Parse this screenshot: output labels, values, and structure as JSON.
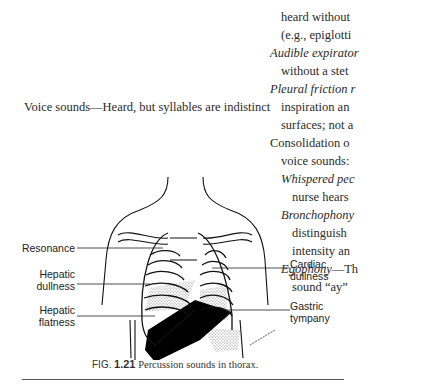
{
  "right_column": {
    "lines": [
      {
        "text": "heard without",
        "style": "normal",
        "indent": true
      },
      {
        "text": "(e.g., epiglotti",
        "style": "normal",
        "indent": true
      },
      {
        "term": "Audible expirator",
        "style": "italic",
        "indent": false
      },
      {
        "text": "without a stet",
        "style": "normal",
        "indent": true
      },
      {
        "term": "Pleural friction r",
        "style": "italic",
        "indent": false
      },
      {
        "text": "inspiration an",
        "style": "normal",
        "indent": true
      },
      {
        "text": "surfaces; not a",
        "style": "normal",
        "indent": true
      },
      {
        "text": "Consolidation o",
        "style": "normal",
        "indent": false
      },
      {
        "text": "voice sounds:",
        "style": "normal",
        "indent": true
      },
      {
        "term": "Whispered pec",
        "style": "italic",
        "indent": true
      },
      {
        "text": "nurse hears",
        "style": "normal",
        "indent": true,
        "extra_indent": true
      },
      {
        "term": "Bronchophony",
        "style": "italic",
        "indent": true
      },
      {
        "text": "distinguish",
        "style": "normal",
        "indent": true,
        "extra_indent": true
      },
      {
        "text": "intensity an",
        "style": "normal",
        "indent": true,
        "extra_indent": true
      },
      {
        "term": "Egophony",
        "rest": "—Th",
        "style": "italic",
        "indent": true
      },
      {
        "text": "sound “ay”",
        "style": "normal",
        "indent": true,
        "extra_indent": true
      }
    ]
  },
  "voice_sounds": {
    "text": "Voice sounds—Heard, but syllables are indistinct"
  },
  "figure": {
    "labels_left": {
      "resonance": "Resonance",
      "hepatic_dullness_1": "Hepatic",
      "hepatic_dullness_2": "dullness",
      "hepatic_flatness_1": "Hepatic",
      "hepatic_flatness_2": "flatness"
    },
    "labels_right": {
      "cardiac_dullness_1": "Cardiac",
      "cardiac_dullness_2": "dullness",
      "gastric_tympany_1": "Gastric",
      "gastric_tympany_2": "tympany"
    },
    "caption": {
      "prefix": "FIG.",
      "number": "1.21",
      "text": "Percussion sounds in thorax."
    }
  }
}
